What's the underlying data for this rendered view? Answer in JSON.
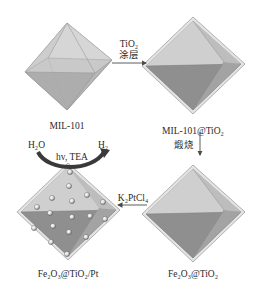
{
  "diagram": {
    "type": "synthesis-scheme",
    "nodes": [
      {
        "id": "mil101",
        "label": "MIL-101",
        "shape": "octahedron"
      },
      {
        "id": "mil101_tio2",
        "label": "MIL-101@TiO₂",
        "shape": "octahedron-with-shell"
      },
      {
        "id": "fe2o3_tio2",
        "label": "Fe₂O₃@TiO₂",
        "shape": "octahedron-with-shell"
      },
      {
        "id": "fe2o3_tio2_pt",
        "label": "Fe₂O₃@TiO₂/Pt",
        "shape": "octahedron-with-shell-and-pt-particles"
      }
    ],
    "steps": [
      {
        "from": "mil101",
        "to": "mil101_tio2",
        "label_top": "TiO₂",
        "label_bottom": "涂层",
        "direction": "right"
      },
      {
        "from": "mil101_tio2",
        "to": "fe2o3_tio2",
        "label": "煅烧",
        "direction": "down"
      },
      {
        "from": "fe2o3_tio2",
        "to": "fe2o3_tio2_pt",
        "label": "K₂PtCl₄",
        "direction": "left"
      }
    ],
    "reaction": {
      "reactant": "H₂O",
      "product": "H₂",
      "conditions": "hv, TEA"
    },
    "colors": {
      "face_light": "#cfcfcf",
      "face_mid": "#b5b5b5",
      "face_dark": "#8e8e8e",
      "shell": "#e6e6e6",
      "arrow": "#4a4a4a",
      "particle": "#f2f2f2"
    }
  }
}
